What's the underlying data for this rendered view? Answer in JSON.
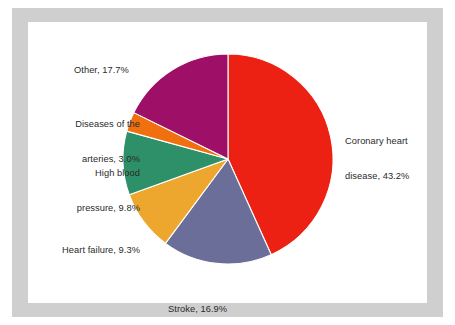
{
  "figure": {
    "background_color": "#ffffff",
    "frame_color": "#cfcfcf",
    "panel_color": "#ffffff",
    "label_color": "#2a2a2a",
    "separator_color": "#ffffff"
  },
  "chart_data": {
    "type": "pie",
    "title": "",
    "xlabel": "",
    "ylabel": "",
    "grid": false,
    "legend_position": "none",
    "label_format": "name, percent",
    "start_angle_deg": 0,
    "direction": "clockwise",
    "categories": [
      "Coronary heart disease",
      "Stroke",
      "Heart failure",
      "High blood pressure",
      "Diseases of the arteries",
      "Other"
    ],
    "values": [
      43.2,
      16.9,
      9.3,
      9.8,
      3.0,
      17.7
    ],
    "colors": [
      "#ed2113",
      "#6b6e99",
      "#eda72e",
      "#2e9068",
      "#f07010",
      "#9e0f68"
    ],
    "slices": [
      {
        "name": "Coronary heart disease",
        "value": 43.2,
        "color": "#ed2113",
        "label_line1": "Coronary heart",
        "label_line2": "disease, 43.2%",
        "label_full": "Coronary heart disease, 43.2%"
      },
      {
        "name": "Stroke",
        "value": 16.9,
        "color": "#6b6e99",
        "label_line1": "Stroke, 16.9%",
        "label_line2": "",
        "label_full": "Stroke, 16.9%"
      },
      {
        "name": "Heart failure",
        "value": 9.3,
        "color": "#eda72e",
        "label_line1": "Heart failure, 9.3%",
        "label_line2": "",
        "label_full": "Heart failure, 9.3%"
      },
      {
        "name": "High blood pressure",
        "value": 9.8,
        "color": "#2e9068",
        "label_line1": "High blood",
        "label_line2": "pressure, 9.8%",
        "label_full": "High blood pressure, 9.8%"
      },
      {
        "name": "Diseases of the arteries",
        "value": 3.0,
        "color": "#f07010",
        "label_line1": "Diseases of the",
        "label_line2": "arteries, 3.0%",
        "label_full": "Diseases of the arteries, 3.0%"
      },
      {
        "name": "Other",
        "value": 17.7,
        "color": "#9e0f68",
        "label_line1": "Other, 17.7%",
        "label_line2": "",
        "label_full": "Other, 17.7%"
      }
    ]
  }
}
